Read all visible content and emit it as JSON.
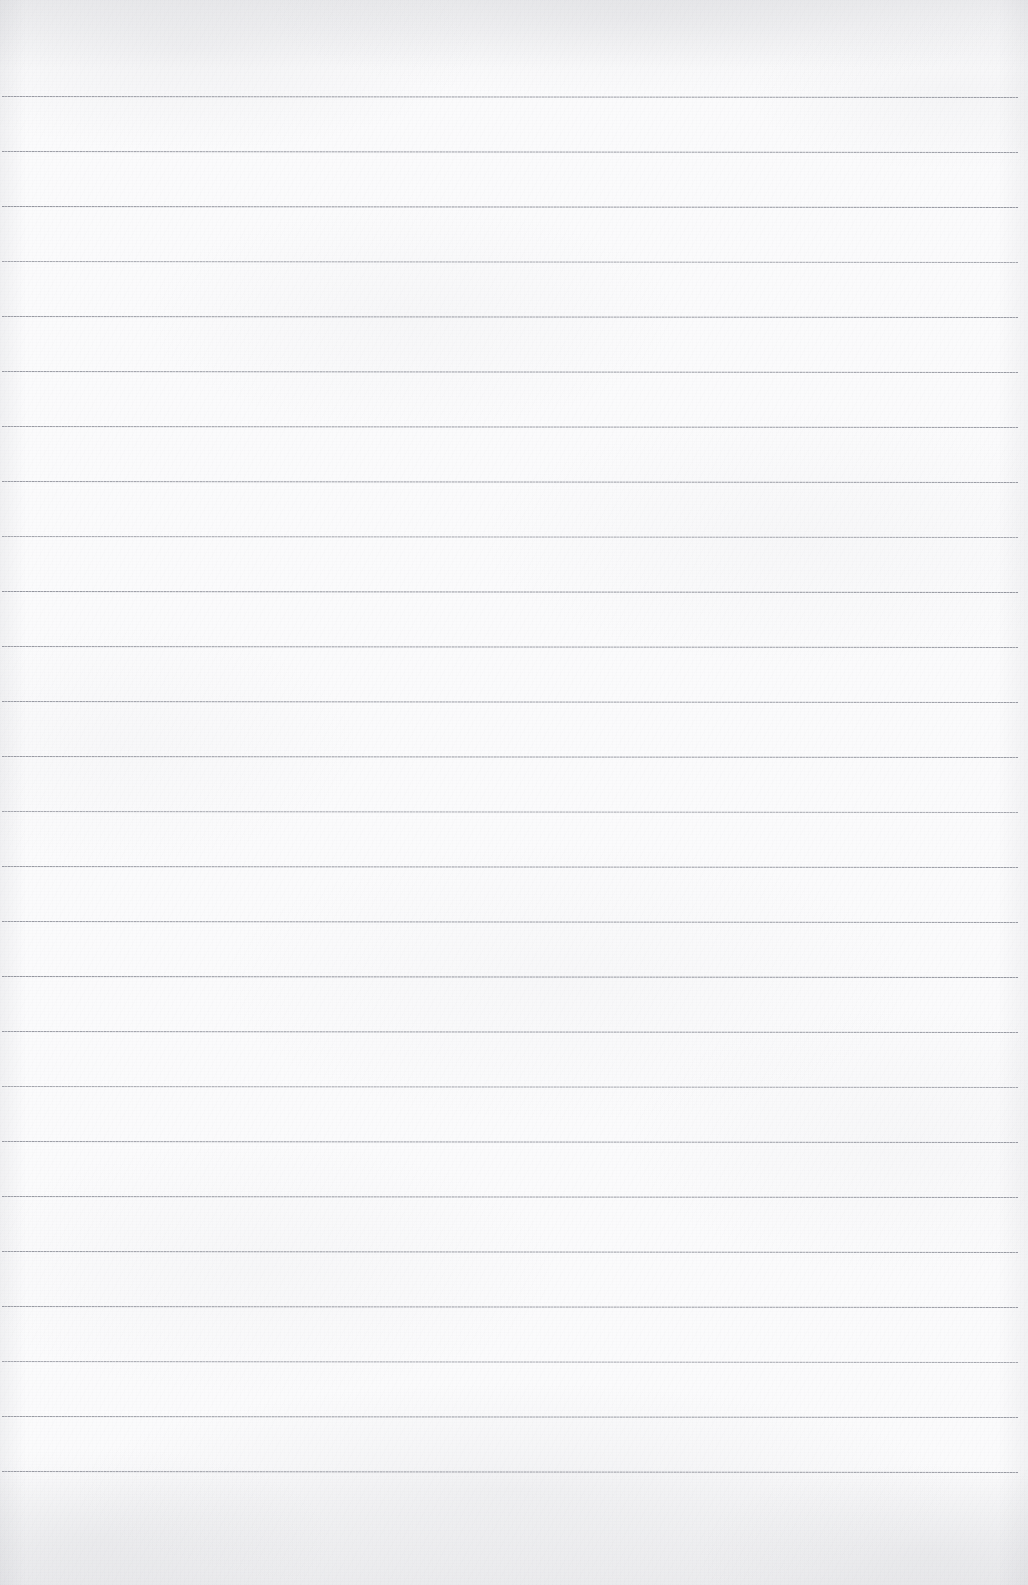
{
  "document": {
    "kind": "scanned-lined-notebook-page",
    "title": "Blank Lined Notebook Page",
    "orientation": "portrait",
    "width": 1028,
    "height": 1585,
    "has_text": false,
    "has_handwriting": false,
    "content_note": "Empty ruled page — no writing, headings, numbers or marks present."
  },
  "colors": {
    "paper": "#fbfbfc",
    "paper_shadow": "#8f919a",
    "rule_line": "#9a9ca4",
    "rule_line_dark": "#8e9099",
    "rule_line_light": "#c6c8ce"
  },
  "ruling": {
    "style": "wide-ruled-horizontal",
    "line_count": 26,
    "first_line_y": 96,
    "line_spacing": 55,
    "line_thickness": 1,
    "line_start_x": 2,
    "line_end_x": 1018,
    "top_margin": 96,
    "bottom_margin": 115,
    "left_margin": 2,
    "right_margin": 10,
    "has_vertical_margin_rule": false,
    "lines_y": [
      96,
      151,
      206,
      261,
      316,
      371,
      426,
      481,
      536,
      591,
      646,
      701,
      756,
      811,
      866,
      921,
      976,
      1031,
      1086,
      1141,
      1196,
      1251,
      1306,
      1361,
      1416,
      1471
    ]
  },
  "texture": {
    "description": "light gray mottled scan noise, strongest along the top and bottom edges",
    "grain_opacity": 0.55
  }
}
